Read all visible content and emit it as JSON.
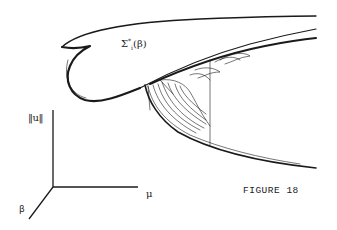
{
  "figure": {
    "caption": "FIGURE 18",
    "surface_label": {
      "symbol": "Σ",
      "subscript": "i",
      "superscript": "*",
      "argument": "(β)"
    },
    "axes": {
      "vertical": "‖u‖",
      "horizontal": "μ",
      "depth": "β"
    },
    "colors": {
      "ink": "#1a1a1a",
      "background": "#ffffff"
    }
  }
}
